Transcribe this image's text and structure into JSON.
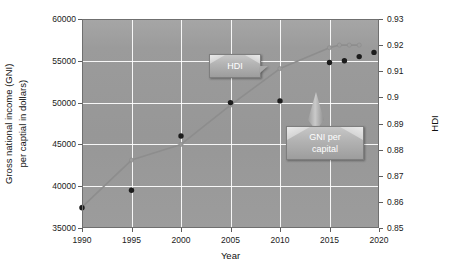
{
  "chart_data": {
    "type": "scatter",
    "title": "",
    "xlabel": "Year",
    "ylabel": "Gross national income (GNI) per captial in dollars)",
    "y2label": "HDI",
    "x": [
      1990,
      1995,
      2000,
      2005,
      2010,
      2015,
      2016,
      2017,
      2018
    ],
    "xlim": [
      1990,
      2020
    ],
    "xticks": [
      "1990",
      "1995",
      "2000",
      "2005",
      "2010",
      "2015",
      "2020"
    ],
    "xtick_values": [
      1990,
      1995,
      2000,
      2005,
      2010,
      2015,
      2020
    ],
    "ylim": [
      35000,
      60000
    ],
    "yticks": [
      "35000",
      "40000",
      "45000",
      "50000",
      "55000",
      "60000"
    ],
    "ytick_values": [
      35000,
      40000,
      45000,
      50000,
      55000,
      60000
    ],
    "y2lim": [
      0.85,
      0.93
    ],
    "y2ticks": [
      "0.85",
      "0.86",
      "0.87",
      "0.88",
      "0.89",
      "0.9",
      "0.91",
      "0.92",
      "0.93"
    ],
    "y2tick_values": [
      0.85,
      0.86,
      0.87,
      0.88,
      0.89,
      0.9,
      0.91,
      0.92,
      0.93
    ],
    "grid": true,
    "legend_position": "none",
    "series": [
      {
        "name": "GNI per capital",
        "axis": "left",
        "style": "scatter",
        "color": "#1c1c1c",
        "values": [
          37400,
          39500,
          46000,
          50000,
          50200,
          54800,
          55000,
          55500,
          56000
        ]
      },
      {
        "name": "HDI",
        "axis": "right",
        "style": "line",
        "color": "#8f8f8f",
        "values": [
          0.858,
          0.876,
          0.882,
          0.897,
          0.911,
          0.919,
          0.92,
          0.92,
          0.92
        ]
      }
    ],
    "annotations": [
      {
        "name": "HDI",
        "text": "HDI",
        "points_to": "hdi-line"
      },
      {
        "name": "GNI per capital",
        "text": "GNI per\ncapital",
        "points_to": "gni-scatter"
      }
    ]
  },
  "axes": {
    "y_title": "Gross national income (GNI)",
    "y_title_2": "per captial in dollars)",
    "y2_title": "HDI",
    "x_title": "Year"
  },
  "callouts": {
    "hdi": {
      "label": "HDI"
    },
    "gni": {
      "line1": "GNI per",
      "line2": "capital"
    }
  },
  "colors": {
    "plot_background": "#9a9a9a",
    "gridline": "#ffffff",
    "gni_marker": "#1c1c1c",
    "hdi_line": "#8f8f8f",
    "callout_fill": "#b4b4b4",
    "text": "#111111"
  }
}
